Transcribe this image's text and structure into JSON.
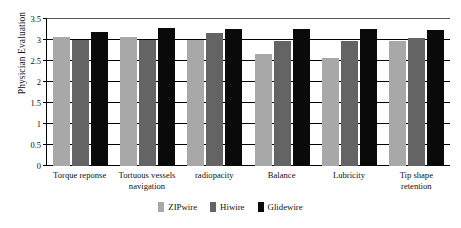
{
  "chart_data": {
    "type": "bar",
    "title": "",
    "subtitle": "",
    "xlabel": "",
    "ylabel": "Physician Evaluation",
    "ylim": [
      0,
      3.5
    ],
    "yticks": [
      "0",
      "0.5",
      "1",
      "1.5",
      "2",
      "2.5",
      "3",
      "3.5"
    ],
    "ytick_values": [
      0,
      0.5,
      1,
      1.5,
      2,
      2.5,
      3,
      3.5
    ],
    "grid": true,
    "legend_position": "bottom-center",
    "categories": [
      "Torque reponse",
      "Tortuous vessels navigation",
      "radiopacity",
      "Balance",
      "Lubricity",
      "Tip shape retention"
    ],
    "series": [
      {
        "name": "ZIPwire",
        "color": "#a8a8a8",
        "values": [
          3.08,
          3.08,
          3.0,
          2.67,
          2.56,
          2.98
        ]
      },
      {
        "name": "Hiwire",
        "color": "#646464",
        "values": [
          3.0,
          3.0,
          3.17,
          2.98,
          2.98,
          3.05
        ]
      },
      {
        "name": "Glidewire",
        "color": "#0a0a0a",
        "values": [
          3.18,
          3.28,
          3.27,
          3.26,
          3.26,
          3.25
        ]
      }
    ]
  }
}
